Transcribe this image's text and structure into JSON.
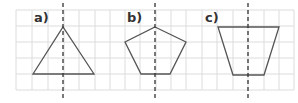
{
  "figures": [
    {
      "label": "a)",
      "shape": "triangle",
      "axis_x": 63,
      "points": "33,74 63,27 94,74",
      "label_x": 34,
      "label_y": 22
    },
    {
      "label": "b)",
      "shape": "pentagon",
      "axis_x": 155,
      "points": "155,27 186,42 170,74 141,74 125,42",
      "label_x": 127,
      "label_y": 22
    },
    {
      "label": "c)",
      "shape": "trapezoid",
      "axis_x": 248,
      "points": "218,27 279,27 264,75 233,75",
      "label_x": 205,
      "label_y": 22
    }
  ],
  "colors": {
    "grid": "#dcdcdc",
    "shape": "#555555",
    "axis": "#333333"
  }
}
